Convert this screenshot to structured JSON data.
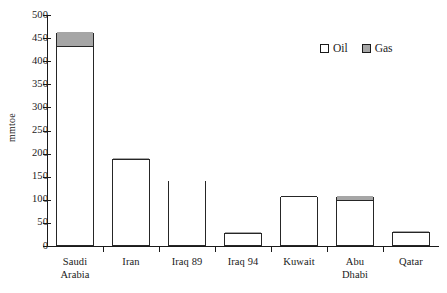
{
  "chart_data": {
    "type": "bar",
    "stacked": true,
    "title": "",
    "xlabel": "",
    "ylabel": "mmtoe",
    "ylim": [
      0,
      500
    ],
    "ytick_step": 50,
    "yticks": [
      0,
      50,
      100,
      150,
      200,
      250,
      300,
      350,
      400,
      450,
      500
    ],
    "grid": false,
    "legend_position": "top-right",
    "categories": [
      "Saudi Arabia",
      "Iran",
      "Iraq 89",
      "Iraq 94",
      "Kuwait",
      "Abu Dhabi",
      "Qatar"
    ],
    "category_lines": [
      [
        "Saudi",
        "Arabia"
      ],
      [
        "Iran"
      ],
      [
        "Iraq 89"
      ],
      [
        "Iraq 94"
      ],
      [
        "Kuwait"
      ],
      [
        "Abu",
        "Dhabi"
      ],
      [
        "Qatar"
      ]
    ],
    "series": [
      {
        "name": "Oil",
        "color": "#ffffff",
        "values": [
          428,
          183,
          141,
          24,
          104,
          96,
          25
        ]
      },
      {
        "name": "Gas",
        "color": "#a6a6a6",
        "values": [
          32,
          6,
          0,
          5,
          2,
          11,
          6
        ]
      }
    ],
    "totals": [
      460,
      189,
      141,
      29,
      106,
      107,
      31
    ]
  },
  "legend": {
    "items": [
      {
        "label": "Oil",
        "swatch": "oil-swatch"
      },
      {
        "label": "Gas",
        "swatch": "gas-swatch"
      }
    ]
  },
  "axis": {
    "y_title": "mmtoe",
    "y_tick_labels": [
      "500",
      "450",
      "400",
      "350",
      "300",
      "250",
      "200",
      "150",
      "100",
      "50",
      "0"
    ]
  },
  "colors": {
    "oil": "#ffffff",
    "gas": "#a6a6a6",
    "outline": "#262626",
    "axis": "#1a1a1a",
    "background": "#ffffff"
  }
}
